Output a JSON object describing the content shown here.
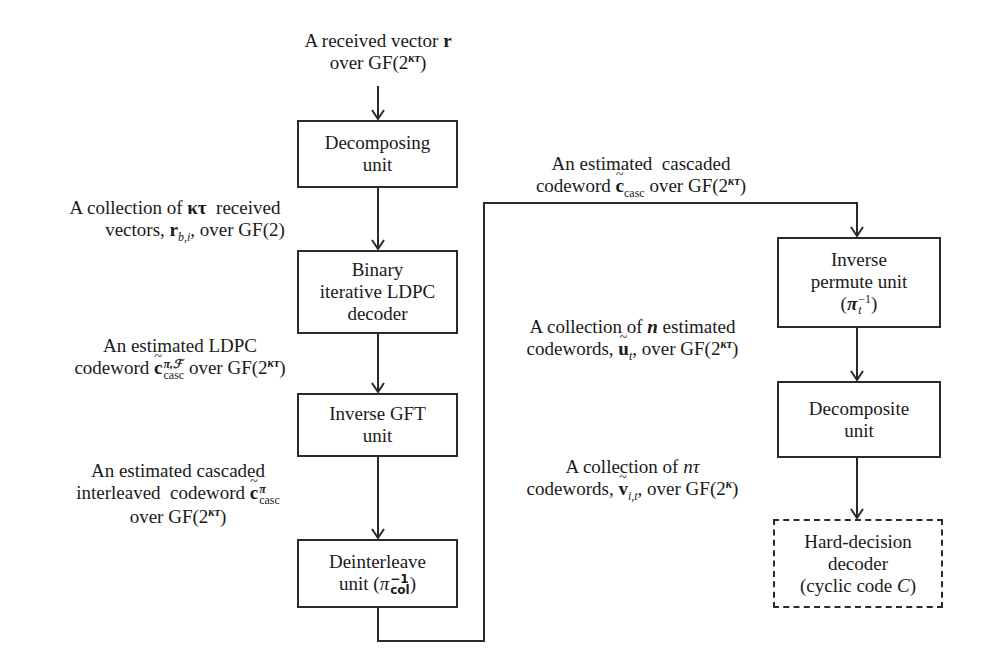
{
  "diagram": {
    "type": "flowchart",
    "colors": {
      "stroke": "#2a2a2a",
      "text": "#1a1a1a",
      "background": "#ffffff"
    },
    "boxes": {
      "decomposing": {
        "lines": [
          "Decomposing",
          "unit"
        ]
      },
      "binary_ldpc": {
        "lines": [
          "Binary",
          "iterative LDPC",
          "decoder"
        ]
      },
      "inverse_gft": {
        "lines": [
          "Inverse GFT",
          "unit"
        ]
      },
      "deinterleave": {
        "line1": "Deinterleave",
        "line2_prefix": "unit (",
        "symbol": "π",
        "sup": "−1",
        "sub": "col",
        "line2_suffix": ")"
      },
      "inverse_permute": {
        "line1": "Inverse",
        "line2": "permute unit",
        "line3_prefix": "(",
        "symbol": "π",
        "sub": "t",
        "sup": "−1",
        "line3_suffix": ")"
      },
      "decomposite": {
        "lines": [
          "Decomposite",
          "unit"
        ]
      },
      "hard_decision": {
        "line1": "Hard-decision",
        "line2": "decoder",
        "line3_prefix": "(cyclic code ",
        "line3_var": "C",
        "line3_suffix": ")",
        "style": "dashed"
      }
    },
    "labels": {
      "input": {
        "line1_prefix": "A received vector ",
        "line1_var": "r",
        "line2_prefix": "over GF(2",
        "line2_sup": "κτ",
        "line2_suffix": ")"
      },
      "after_decomposing": {
        "line1_prefix": "A collection of ",
        "line1_var": "κτ",
        "line1_suffix": "  received",
        "line2_prefix": "vectors, ",
        "line2_var": "r",
        "line2_sub": "b,i",
        "line2_suffix": ", over GF(2)"
      },
      "after_ldpc": {
        "line1": "An estimated LDPC",
        "line2_prefix": "codeword ",
        "line2_var": "c",
        "line2_sup": "π,ℱ",
        "line2_sub": "casc",
        "line2_mid": " over GF(2",
        "line2_sup2": "κτ",
        "line2_suffix": ")"
      },
      "after_gft": {
        "line1": "An estimated cascaded",
        "line2_prefix": "interleaved  codeword ",
        "line2_var": "c",
        "line2_sup": "π",
        "line2_sub": "casc",
        "line3_prefix": "over GF(2",
        "line3_sup": "κτ",
        "line3_suffix": ")"
      },
      "after_deinterleave": {
        "line1": "An estimated  cascaded",
        "line2_prefix": "codeword ",
        "line2_var": "c",
        "line2_sub": "casc",
        "line2_mid": " over GF(2",
        "line2_sup": "κτ",
        "line2_suffix": ")"
      },
      "after_permute": {
        "line1_prefix": "A collection of ",
        "line1_var": "n",
        "line1_suffix": " estimated",
        "line2_prefix": "codewords, ",
        "line2_var": "u",
        "line2_sub": "t",
        "line2_mid": ", over GF(2",
        "line2_sup": "κτ",
        "line2_suffix": ")"
      },
      "after_decomposite": {
        "line1_prefix": "A collection of ",
        "line1_var": "nτ",
        "line2_prefix": "codewords, ",
        "line2_var": "v",
        "line2_sub": "i,t",
        "line2_mid": ", over GF(2",
        "line2_sup": "κ",
        "line2_suffix": ")"
      }
    }
  }
}
